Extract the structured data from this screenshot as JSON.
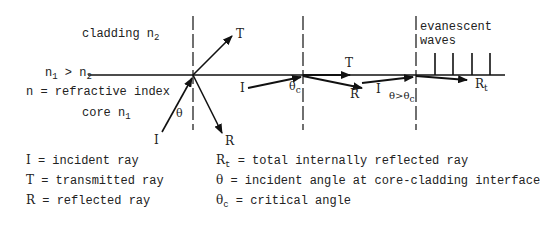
{
  "diagram": {
    "labels": {
      "cladding": "cladding n",
      "cladding_sub": "2",
      "core": "core n",
      "core_sub": "1",
      "index_rel_a": "n",
      "index_rel_a_sub": "1",
      "index_rel_mid": " > n",
      "index_rel_b_sub": "2",
      "refractive_index": "n = refractive index",
      "evanescent": "evanescent",
      "waves": "waves"
    },
    "interfaces": [
      {
        "id": "refraction",
        "incident": "I",
        "transmitted": "T",
        "reflected": "R",
        "angle": "θ"
      },
      {
        "id": "critical",
        "incident": "I",
        "transmitted": "T",
        "reflected": "R",
        "angle": "θ",
        "angle_sub": "c"
      },
      {
        "id": "tir",
        "incident": "I",
        "reflected": "R",
        "reflected_sub": "t",
        "angle": "θ>θ",
        "angle_sub": "c"
      }
    ]
  },
  "legend": {
    "left": [
      {
        "symbol": "I",
        "text": " = incident ray"
      },
      {
        "symbol": "T",
        "text": " = transmitted ray"
      },
      {
        "symbol": "R",
        "text": " = reflected ray"
      }
    ],
    "right": [
      {
        "symbol": "R",
        "symbol_sub": "t",
        "text": " = total internally reflected ray"
      },
      {
        "symbol": "θ",
        "symbol_sub": "",
        "text": " = incident angle at core-cladding interface"
      },
      {
        "symbol": "θ",
        "symbol_sub": "c",
        "text": " = critical angle"
      }
    ]
  }
}
